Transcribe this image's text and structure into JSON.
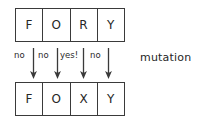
{
  "figure": {
    "caption": "mutation",
    "top_sequence": {
      "label": "original sequence",
      "cells": [
        "F",
        "O",
        "R",
        "Y"
      ]
    },
    "bottom_sequence": {
      "label": "mutated sequence",
      "cells": [
        "F",
        "O",
        "X",
        "Y"
      ]
    },
    "transitions": [
      {
        "label": "no",
        "changed": false,
        "icon": "down-arrow-icon"
      },
      {
        "label": "no",
        "changed": false,
        "icon": "down-arrow-icon"
      },
      {
        "label": "yes!",
        "changed": true,
        "icon": "down-arrow-icon"
      },
      {
        "label": "no",
        "changed": false,
        "icon": "down-arrow-icon"
      }
    ]
  },
  "colors": {
    "stroke": "#3a3a3a",
    "text": "#262626",
    "background": "#ffffff"
  }
}
